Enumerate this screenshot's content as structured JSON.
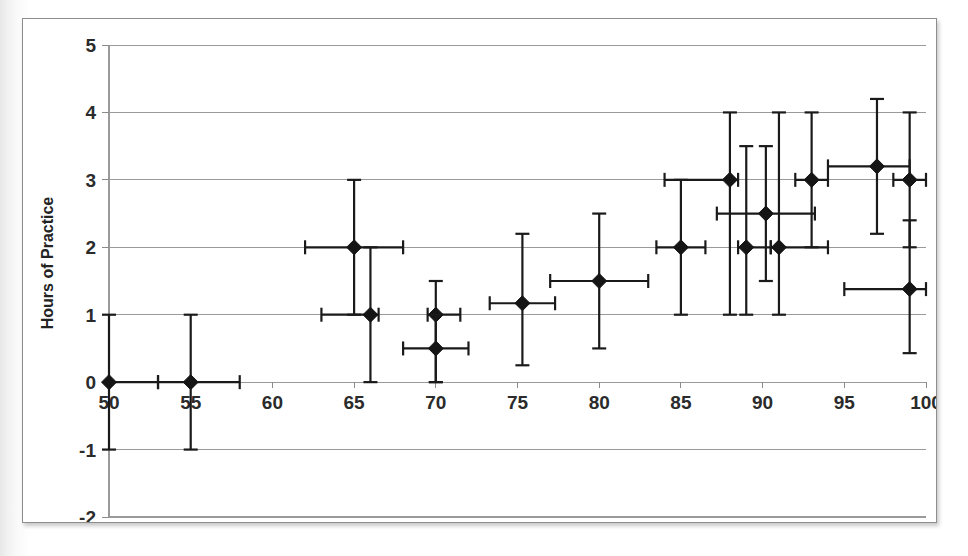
{
  "chart_data": {
    "type": "scatter",
    "title": "",
    "xlabel": "",
    "ylabel": "Hours of Practice",
    "xlim": [
      50,
      100
    ],
    "ylim": [
      -2,
      5
    ],
    "xticks": [
      50,
      55,
      60,
      65,
      70,
      75,
      80,
      85,
      90,
      95,
      100
    ],
    "yticks": [
      -2,
      -1,
      0,
      1,
      2,
      3,
      4,
      5
    ],
    "grid": true,
    "legend": null,
    "marker_style": "filled-diamond",
    "error_bars": "both x and y",
    "colors": {
      "marker": "#151515",
      "error_bar": "#1a1a1a",
      "gridline": "#9a9a9a",
      "frame": "#8d8d8d",
      "background": "#ffffff",
      "text": "#2b2b2b"
    },
    "points": [
      {
        "x": 50,
        "y": 0,
        "xerr_low": 0,
        "xerr_high": 3,
        "yerr_low": 1,
        "yerr_high": 1
      },
      {
        "x": 55,
        "y": 0,
        "xerr_low": 2,
        "xerr_high": 3,
        "yerr_low": 1,
        "yerr_high": 1
      },
      {
        "x": 65,
        "y": 2,
        "xerr_low": 3,
        "xerr_high": 3,
        "yerr_low": 1,
        "yerr_high": 1
      },
      {
        "x": 66,
        "y": 1,
        "xerr_low": 3,
        "xerr_high": 0.5,
        "yerr_low": 1,
        "yerr_high": 1
      },
      {
        "x": 70,
        "y": 1,
        "xerr_low": 0.5,
        "xerr_high": 1.5,
        "yerr_low": 1,
        "yerr_high": 0.5
      },
      {
        "x": 70,
        "y": 0.5,
        "xerr_low": 2,
        "xerr_high": 2,
        "yerr_low": 0.5,
        "yerr_high": 0.5
      },
      {
        "x": 75.3,
        "y": 1.17,
        "xerr_low": 2,
        "xerr_high": 2,
        "yerr_low": 0.92,
        "yerr_high": 1.03
      },
      {
        "x": 80,
        "y": 1.5,
        "xerr_low": 3,
        "xerr_high": 3,
        "yerr_low": 1,
        "yerr_high": 1
      },
      {
        "x": 85,
        "y": 2,
        "xerr_low": 1.5,
        "xerr_high": 1.5,
        "yerr_low": 1,
        "yerr_high": 1
      },
      {
        "x": 88,
        "y": 3,
        "xerr_low": 4,
        "xerr_high": 0.5,
        "yerr_low": 2,
        "yerr_high": 1
      },
      {
        "x": 89,
        "y": 2,
        "xerr_low": 0.5,
        "xerr_high": 1.5,
        "yerr_low": 1,
        "yerr_high": 1.5
      },
      {
        "x": 90.2,
        "y": 2.5,
        "xerr_low": 3,
        "xerr_high": 3,
        "yerr_low": 1,
        "yerr_high": 1
      },
      {
        "x": 91,
        "y": 2,
        "xerr_low": 0.5,
        "xerr_high": 3,
        "yerr_low": 1,
        "yerr_high": 2
      },
      {
        "x": 93,
        "y": 3,
        "xerr_low": 1,
        "xerr_high": 1,
        "yerr_low": 1,
        "yerr_high": 1
      },
      {
        "x": 97,
        "y": 3.2,
        "xerr_low": 3,
        "xerr_high": 2,
        "yerr_low": 1,
        "yerr_high": 1
      },
      {
        "x": 99,
        "y": 3,
        "xerr_low": 1,
        "xerr_high": 1,
        "yerr_low": 1,
        "yerr_high": 1
      },
      {
        "x": 99,
        "y": 1.38,
        "xerr_low": 4,
        "xerr_high": 1,
        "yerr_low": 0.95,
        "yerr_high": 1.02
      }
    ]
  },
  "axes": {
    "y_title": "Hours of Practice",
    "y_tick_labels": [
      "5",
      "4",
      "3",
      "2",
      "1",
      "0",
      "-1",
      "-2"
    ],
    "x_tick_labels": [
      "50",
      "55",
      "60",
      "65",
      "70",
      "75",
      "80",
      "85",
      "90",
      "95",
      "100"
    ]
  }
}
